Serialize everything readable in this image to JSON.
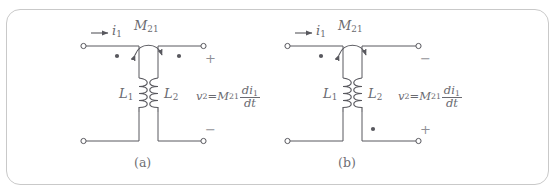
{
  "figure": {
    "border_color": "#c9c9c9",
    "background": "#ffffff",
    "line_color": "#58585e",
    "text_color": "#6a6a70",
    "panels": [
      {
        "id": "panel-a",
        "caption": "(a)",
        "current_label": "i",
        "current_sub": "1",
        "mutual_label": "M",
        "mutual_sub": "21",
        "primary_inductor": "L",
        "primary_inductor_sub": "1",
        "secondary_inductor": "L",
        "secondary_inductor_sub": "2",
        "top_right_sign": "+",
        "bottom_right_sign": "−",
        "primary_dot_position": "top",
        "secondary_dot_position": "top",
        "equation": {
          "lhs": "v",
          "lhs_sub": "2",
          "equals": "=",
          "coef": "M",
          "coef_sub": "21",
          "numerator": "di",
          "numerator_sub": "1",
          "denominator": "dt",
          "plain": "v2 = M21 di1/dt"
        }
      },
      {
        "id": "panel-b",
        "caption": "(b)",
        "current_label": "i",
        "current_sub": "1",
        "mutual_label": "M",
        "mutual_sub": "21",
        "primary_inductor": "L",
        "primary_inductor_sub": "1",
        "secondary_inductor": "L",
        "secondary_inductor_sub": "2",
        "top_right_sign": "−",
        "bottom_right_sign": "+",
        "primary_dot_position": "top",
        "secondary_dot_position": "bottom",
        "equation": {
          "lhs": "v",
          "lhs_sub": "2",
          "equals": "=",
          "coef": "M",
          "coef_sub": "21",
          "numerator": "di",
          "numerator_sub": "1",
          "denominator": "dt",
          "plain": "v2 = M21 di1/dt"
        }
      }
    ]
  }
}
